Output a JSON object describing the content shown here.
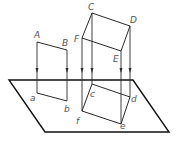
{
  "diagram": {
    "title": "",
    "colors": {
      "stroke": "#2a2a2a",
      "label": "#555555",
      "background": "#ffffff"
    },
    "plane": {
      "points": [
        [
          9,
          80
        ],
        [
          133,
          80
        ],
        [
          169,
          132
        ],
        [
          45,
          132
        ]
      ]
    },
    "segment_AB": {
      "upper": {
        "A": [
          37,
          42
        ],
        "B": [
          67,
          50
        ]
      },
      "lower": {
        "a": [
          37,
          93
        ],
        "b": [
          67,
          101
        ]
      }
    },
    "rectangle_CDEF": {
      "upper": {
        "C": [
          92,
          13
        ],
        "D": [
          130,
          26
        ],
        "E": [
          121,
          51
        ],
        "F": [
          82,
          38
        ]
      },
      "lower": {
        "c": [
          92,
          84
        ],
        "d": [
          130,
          97
        ],
        "e": [
          121,
          124
        ],
        "f": [
          82,
          111
        ]
      }
    },
    "labels": {
      "A": "A",
      "B": "B",
      "C": "C",
      "D": "D",
      "E": "E",
      "F": "F",
      "a": "a",
      "b": "b",
      "c": "c",
      "d": "d",
      "e": "e",
      "f": "f"
    }
  }
}
